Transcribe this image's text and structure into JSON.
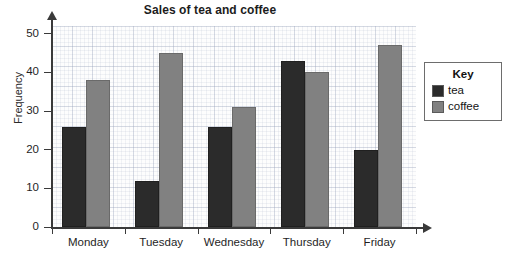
{
  "chart_data": {
    "type": "bar",
    "title": "Sales of tea and coffee",
    "xlabel": "",
    "ylabel": "Frequency",
    "categories": [
      "Monday",
      "Tuesday",
      "Wednesday",
      "Thursday",
      "Friday"
    ],
    "series": [
      {
        "name": "tea",
        "color": "#2b2b2b",
        "values": [
          26,
          12,
          26,
          43,
          20
        ]
      },
      {
        "name": "coffee",
        "color": "#818181",
        "values": [
          38,
          45,
          31,
          40,
          47
        ]
      }
    ],
    "ylim": [
      0,
      52
    ],
    "yticks": [
      0,
      10,
      20,
      30,
      40,
      50
    ],
    "ytick_labels": [
      "0",
      "10",
      "20",
      "30",
      "40",
      "50"
    ],
    "grid": true,
    "grid_minor": true,
    "grid_major_step": 5,
    "legend_position": "right",
    "legend_title": "Key"
  },
  "legend": {
    "title": "Key",
    "entries": [
      {
        "label": "tea"
      },
      {
        "label": "coffee"
      }
    ]
  },
  "colors": {
    "tea": "#2b2b2b",
    "coffee": "#818181",
    "axis": "#3a3a3a",
    "grid": "#96a0b9",
    "background": "#ffffff"
  }
}
